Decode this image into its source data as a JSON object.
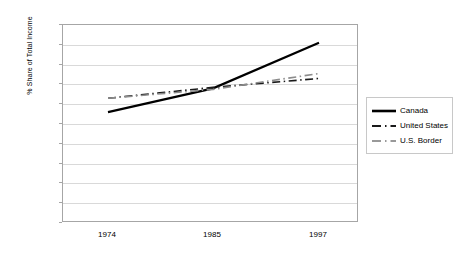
{
  "chart_data": {
    "type": "line",
    "title": "",
    "xlabel": "",
    "ylabel": "% Share of Total Income",
    "categories": [
      "1974",
      "1985",
      "1997"
    ],
    "x_tick_labels": [
      "1974",
      "1985",
      "1997"
    ],
    "y_tick_labels": [
      "10",
      "9",
      "8",
      "7",
      "6",
      "5",
      "4",
      "3",
      "2",
      "1",
      "0"
    ],
    "ylim": [
      0,
      10
    ],
    "y_major_step": 1,
    "grid": "horizontal",
    "legend_position": "right",
    "series": [
      {
        "name": "Canada",
        "values": [
          5.6,
          6.8,
          9.1
        ],
        "color": "#000000",
        "style": "solid",
        "width": 2.2
      },
      {
        "name": "United States",
        "values": [
          6.3,
          6.85,
          7.3
        ],
        "color": "#1a1a1a",
        "style": "dash-dot",
        "width": 1.6
      },
      {
        "name": "U.S. Border",
        "values": [
          6.3,
          6.75,
          7.55
        ],
        "color": "#8c8c8c",
        "style": "dash-dot",
        "width": 1.6
      }
    ]
  },
  "axes": {
    "y_title": "% Share of Total Income",
    "y_labels": [
      "10",
      "9",
      "8",
      "7",
      "6",
      "5",
      "4",
      "3",
      "2",
      "1",
      "0"
    ],
    "x_labels": [
      "1974",
      "1985",
      "1997"
    ]
  },
  "legend": {
    "items": [
      {
        "label": "Canada"
      },
      {
        "label": "United States"
      },
      {
        "label": "U.S. Border"
      }
    ]
  }
}
